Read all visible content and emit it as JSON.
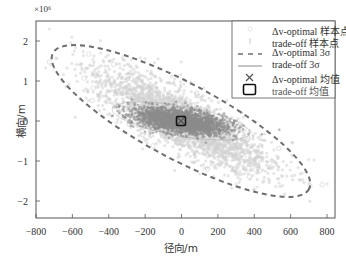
{
  "chart_data": {
    "type": "scatter",
    "title": "",
    "xlabel": "径向/m",
    "ylabel": "横向/m",
    "y_exponent": "×10⁶",
    "xlim": [
      -800,
      845
    ],
    "ylim": [
      -2.45,
      2.5
    ],
    "x_ticks": [
      -800,
      -600,
      -400,
      -200,
      0,
      200,
      400,
      600,
      800
    ],
    "x_tick_labels": [
      "−800",
      "−600",
      "−400",
      "−200",
      "0",
      "200",
      "400",
      "600",
      "800"
    ],
    "y_ticks": [
      -2,
      -1,
      0,
      1,
      2
    ],
    "y_tick_labels": [
      "−2",
      "−1",
      "0",
      "1",
      "2"
    ],
    "grid": false,
    "legend_position": "upper right",
    "series": [
      {
        "name": "Δv-optimal 样本点",
        "kind": "scatter",
        "marker": "circle-open",
        "color": "#cfcfcf",
        "center": [
          0,
          0
        ],
        "approx_extent_x": [
          -650,
          650
        ],
        "approx_extent_y": [
          -2.1,
          2.2
        ],
        "orientation": "negative correlation (upper-left to lower-right)"
      },
      {
        "name": "trade-off 样本点",
        "kind": "scatter",
        "marker": "plus",
        "color": "#8a8a8a",
        "center": [
          0,
          0
        ],
        "approx_extent_x": [
          -350,
          400
        ],
        "approx_extent_y": [
          -0.5,
          0.5
        ]
      },
      {
        "name": "Δv-optimal 3σ",
        "kind": "ellipse",
        "line_style": "dashed",
        "color": "#707070",
        "center": [
          0,
          0
        ],
        "approx_extent_x": [
          -650,
          640
        ],
        "approx_extent_y": [
          -1.75,
          1.6
        ]
      },
      {
        "name": "trade-off 3σ",
        "kind": "ellipse",
        "line_style": "solid",
        "color": "#8a8a8a",
        "center": [
          0,
          0
        ],
        "approx_extent_x": [
          -350,
          400
        ],
        "approx_extent_y": [
          -0.5,
          0.5
        ]
      },
      {
        "name": "Δv-optimal 均值",
        "kind": "point",
        "marker": "x",
        "color": "#555555",
        "x": 0,
        "y": 0
      },
      {
        "name": "trade-off 均值",
        "kind": "point",
        "marker": "square-open",
        "color": "#111111",
        "x": 0,
        "y": 0
      }
    ]
  },
  "axes": {
    "xlabel": "径向/m",
    "ylabel": "横向/m",
    "exponent": "×10⁶",
    "x_tick_labels": [
      "−800",
      "−600",
      "−400",
      "−200",
      "0",
      "200",
      "400",
      "600",
      "800"
    ],
    "y_tick_labels": [
      "2",
      "1",
      "0",
      "−1",
      "−2"
    ]
  },
  "legend": {
    "items": [
      {
        "label": "Δv-optimal 样本点"
      },
      {
        "label": "trade-off 样本点"
      },
      {
        "label": "Δv-optimal 3σ"
      },
      {
        "label": "trade-off 3σ"
      },
      {
        "label": "Δv-optimal 均值"
      },
      {
        "label": "trade-off 均值"
      }
    ]
  },
  "colors": {
    "light_samples": "#d2d2d2",
    "dark_samples": "#8c8c8c",
    "dashed_ellipse": "#6e6e6e",
    "axis": "#555555",
    "mean_square": "#111111"
  }
}
